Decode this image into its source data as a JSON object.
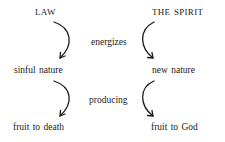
{
  "diagram": {
    "left_column": {
      "top": "LAW",
      "middle": "sinful nature",
      "bottom": "fruit to death"
    },
    "right_column": {
      "top": "THE SPIRIT",
      "middle": "new nature",
      "bottom": "fruit to God"
    },
    "connectors": {
      "upper": "energizes",
      "lower": "producing"
    },
    "colors": {
      "text": "#1a1a1a",
      "arrow": "#1a1a1a",
      "background": "#ffffff"
    }
  }
}
